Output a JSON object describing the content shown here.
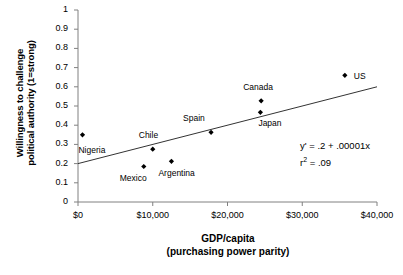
{
  "chart_data": {
    "type": "scatter",
    "title": "",
    "xlabel": "GDP/capita",
    "xlabel_line2": "(purchasing power parity)",
    "ylabel_line1": "Willingness to challenge",
    "ylabel_line2": "political authority (1=strong)",
    "xlim": [
      0,
      40000
    ],
    "ylim": [
      0,
      1
    ],
    "grid": false,
    "legend": "none",
    "x_ticks": [
      0,
      10000,
      20000,
      30000,
      40000
    ],
    "x_tick_labels": [
      "$0",
      "$10,000",
      "$20,000",
      "$30,000",
      "$40,000"
    ],
    "y_ticks": [
      0,
      0.1,
      0.2,
      0.3,
      0.4,
      0.5,
      0.6,
      0.7,
      0.8,
      0.9,
      1
    ],
    "y_tick_labels": [
      "0",
      "0.1",
      "0.2",
      "0.3",
      "0.4",
      "0.5",
      "0.6",
      "0.7",
      "0.8",
      "0.9",
      "1"
    ],
    "points": [
      {
        "name": "Nigeria",
        "x": 600,
        "y": 0.35,
        "label_dx": -4,
        "label_dy": 16
      },
      {
        "name": "Mexico",
        "x": 8800,
        "y": 0.185,
        "label_dx": -24,
        "label_dy": 13
      },
      {
        "name": "Chile",
        "x": 10000,
        "y": 0.275,
        "label_dx": -14,
        "label_dy": -13
      },
      {
        "name": "Argentina",
        "x": 12500,
        "y": 0.212,
        "label_dx": -13,
        "label_dy": 13
      },
      {
        "name": "Spain",
        "x": 17800,
        "y": 0.363,
        "label_dx": -28,
        "label_dy": -13
      },
      {
        "name": "Japan",
        "x": 24400,
        "y": 0.467,
        "label_dx": -2,
        "label_dy": 12
      },
      {
        "name": "Canada",
        "x": 24500,
        "y": 0.527,
        "label_dx": -18,
        "label_dy": -13
      },
      {
        "name": "US",
        "x": 35700,
        "y": 0.66,
        "label_dx": 9,
        "label_dy": 2
      }
    ],
    "trendline": {
      "intercept": 0.2,
      "slope": 1e-05,
      "x_start": 0,
      "x_end": 40000,
      "y_start": 0.2,
      "y_end": 0.6
    },
    "annotation": {
      "equation_prefix": "y",
      "equation_prime": "'",
      "equation_rest": " = .2 + .00001x",
      "r2_prefix": "r",
      "r2_sup": "2",
      "r2_rest": " = .09"
    },
    "colors": {
      "axis": "#808080",
      "marker": "#000000",
      "trendline": "#333333",
      "text": "#000000",
      "background": "#ffffff"
    }
  }
}
